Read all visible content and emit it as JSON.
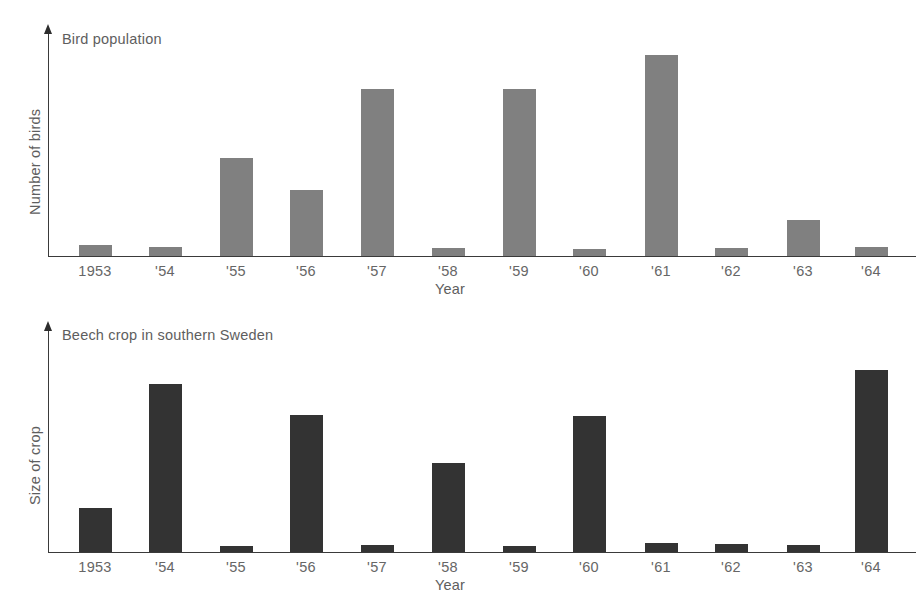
{
  "figure": {
    "background": "#ffffff",
    "text_color": "#5e5e5e",
    "axis_color": "#3a3a3a"
  },
  "chart_data": [
    {
      "id": "bird-population",
      "type": "bar",
      "title": "Bird population",
      "xlabel": "Year",
      "ylabel": "Number of birds",
      "bar_color": "#808080",
      "grid": false,
      "legend": "none",
      "ylim": [
        0,
        220
      ],
      "categories": [
        "1953",
        "'54",
        "'55",
        "'56",
        "'57",
        "'58",
        "'59",
        "'60",
        "'61",
        "'62",
        "'63",
        "'64"
      ],
      "values": [
        11,
        9,
        98,
        66,
        167,
        8,
        167,
        7,
        201,
        8,
        36,
        9
      ]
    },
    {
      "id": "beech-crop",
      "type": "bar",
      "title": "Beech crop in southern Sweden",
      "xlabel": "Year",
      "ylabel": "Size of crop",
      "bar_color": "#333333",
      "grid": false,
      "legend": "none",
      "ylim": [
        0,
        200
      ],
      "categories": [
        "1953",
        "'54",
        "'55",
        "'56",
        "'57",
        "'58",
        "'59",
        "'60",
        "'61",
        "'62",
        "'63",
        "'64"
      ],
      "values": [
        44,
        168,
        6,
        137,
        7,
        89,
        6,
        136,
        9,
        8,
        7,
        182
      ]
    }
  ]
}
